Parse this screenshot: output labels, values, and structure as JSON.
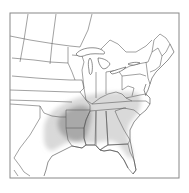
{
  "map": {
    "region": "Eastern North America",
    "frame": {
      "x": 10,
      "y": 13,
      "width": 169,
      "height": 165
    },
    "colors": {
      "background": "#ffffff",
      "range_outer": "#d9d9d9",
      "range_core": "#a9a9a9",
      "state_lines": "#555555",
      "frame": "#888888"
    },
    "layers": [
      {
        "name": "range-outer",
        "label": "Outer range (light shading)",
        "states": [
          "Texas (east)",
          "Oklahoma (southeast)",
          "Arkansas",
          "Louisiana",
          "Mississippi",
          "Alabama",
          "Georgia",
          "Florida",
          "Tennessee",
          "Kentucky (south)",
          "South Carolina",
          "North Carolina",
          "Virginia",
          "Missouri (south)",
          "Illinois (south)"
        ]
      },
      {
        "name": "range-core",
        "label": "Core range (dark shading)",
        "states": [
          "Arkansas",
          "Louisiana (north)",
          "Mississippi (west)",
          "Texas (northeast)",
          "Oklahoma (southeast)"
        ]
      }
    ]
  }
}
